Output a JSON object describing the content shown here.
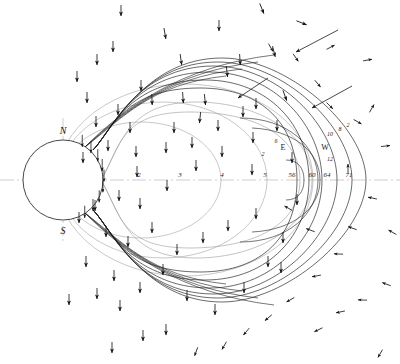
{
  "figure": {
    "type": "magnetosphere-field-line-diagram",
    "background": "#ffffff",
    "line_color": "#1b1b1b",
    "faint_line_color": "#9b9b9b",
    "axis_color": "#b9b9b9",
    "width": 400,
    "height": 364
  },
  "planet": {
    "name": "planet-disc",
    "center_x": 63,
    "center_y": 180,
    "radius": 40,
    "pole_north_label": "N",
    "pole_south_label": "S"
  },
  "axes": {
    "equator_label": "equatorial-axis",
    "polar_label": "polar-axis"
  },
  "equator_ticks": [
    {
      "label": "2",
      "x": 139
    },
    {
      "label": "3",
      "x": 180
    },
    {
      "label": "4",
      "x": 222
    },
    {
      "label": "5",
      "x": 265
    },
    {
      "label": "56",
      "x": 292
    },
    {
      "label": "60",
      "x": 312
    },
    {
      "label": "64",
      "x": 327
    },
    {
      "label": "71",
      "x": 349
    }
  ],
  "field_labels": [
    {
      "label": "E",
      "x": 283,
      "y": 150
    },
    {
      "label": "W",
      "x": 325,
      "y": 150
    },
    {
      "label": "6",
      "x": 276,
      "y": 143
    },
    {
      "label": "2",
      "x": 263,
      "y": 156
    },
    {
      "label": "10",
      "x": 330,
      "y": 136
    },
    {
      "label": "8",
      "x": 340,
      "y": 131
    },
    {
      "label": "2",
      "x": 348,
      "y": 127
    },
    {
      "label": "12",
      "x": 330,
      "y": 161
    }
  ],
  "chart_data": {
    "type": "line",
    "title": "",
    "xlabel": "",
    "ylabel": "",
    "series": [
      {
        "name": "closed-field-line-inner",
        "shell": 1
      },
      {
        "name": "closed-field-line-mid",
        "shell": 2
      },
      {
        "name": "closed-field-line-outer",
        "shell": 3
      },
      {
        "name": "magnetopause-boundary",
        "shell": 4
      },
      {
        "name": "tail-lobe-line",
        "shell": 5
      }
    ],
    "legend_position": "none",
    "grid": false
  }
}
